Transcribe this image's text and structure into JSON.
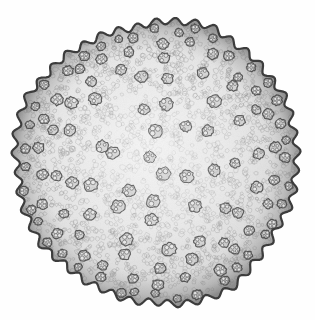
{
  "figure": {
    "kind": "scientific-illustration",
    "style": "engraving / lithograph halftone",
    "title": "",
    "caption": "",
    "background_color": "#fefefe",
    "canvas": {
      "width": 315,
      "height": 320
    }
  },
  "specimen": {
    "outline": {
      "name": "stem-outline",
      "shape": "irregular circle",
      "center_x": 157,
      "center_y": 162,
      "radius": 141,
      "rim_color": "#3c3c3c",
      "rim_thickness": 2.2,
      "lobes": 46,
      "lobe_amplitude": 3.4
    },
    "ground_tissue": {
      "name": "parenchyma-ground-tissue",
      "fill_center_color": "#f2f2f2",
      "fill_mid_color": "#e2e2e2",
      "fill_outer_color": "#bdbdbd",
      "cell_stroke_color": "#9a9a9a",
      "cell_count": 2100,
      "cell_min_radius": 1.5,
      "cell_max_radius": 3.6
    },
    "cortex_band": {
      "name": "cortex-band",
      "inner_radius_fraction": 0.8,
      "outer_radius_fraction": 1.0,
      "shade_color": "#9d9d9d"
    },
    "epidermis": {
      "name": "epidermis-layer",
      "color": "#333333",
      "width": 3
    }
  },
  "vascular_bundles": {
    "label": "vascular bundles",
    "outline_color": "#4a4a4a",
    "vessel_color": "#6e6e6e",
    "fill_color": "#c9c9c9",
    "peripheral_count": 58,
    "inner_count": 44,
    "notes": "scattered atactostele arrangement; small and crowded at periphery, larger and sparse toward centre",
    "rings": [
      {
        "name": "outer-ring",
        "radius_fraction": 0.935,
        "count": 40,
        "bundle_radius": 4.4,
        "jitter": 2.0,
        "vessels": 4
      },
      {
        "name": "second-ring",
        "radius_fraction": 0.845,
        "count": 26,
        "bundle_radius": 5.0,
        "jitter": 3.5,
        "vessels": 4
      },
      {
        "name": "third-ring",
        "radius_fraction": 0.735,
        "count": 18,
        "bundle_radius": 5.4,
        "jitter": 5.0,
        "vessels": 3
      },
      {
        "name": "fourth-ring",
        "radius_fraction": 0.595,
        "count": 13,
        "bundle_radius": 5.8,
        "jitter": 6.5,
        "vessels": 3
      },
      {
        "name": "fifth-ring",
        "radius_fraction": 0.44,
        "count": 9,
        "bundle_radius": 6.0,
        "jitter": 7.5,
        "vessels": 3
      },
      {
        "name": "inner-ring",
        "radius_fraction": 0.265,
        "count": 6,
        "bundle_radius": 6.2,
        "jitter": 8.0,
        "vessels": 3
      },
      {
        "name": "central-group",
        "radius_fraction": 0.105,
        "count": 2,
        "bundle_radius": 6.2,
        "jitter": 6.0,
        "vessels": 3
      }
    ]
  },
  "annotations": {
    "items": []
  }
}
